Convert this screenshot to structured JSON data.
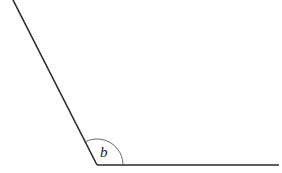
{
  "diagram": {
    "type": "angle",
    "angle_label": "b",
    "colors": {
      "line": "#2a2a2a",
      "arc": "#555555",
      "background": "#ffffff"
    },
    "geometry": {
      "vertex": [
        97,
        165
      ],
      "ray_left_end": [
        13,
        0
      ],
      "ray_right_end": [
        279,
        165
      ],
      "arc_radius": 26
    }
  }
}
